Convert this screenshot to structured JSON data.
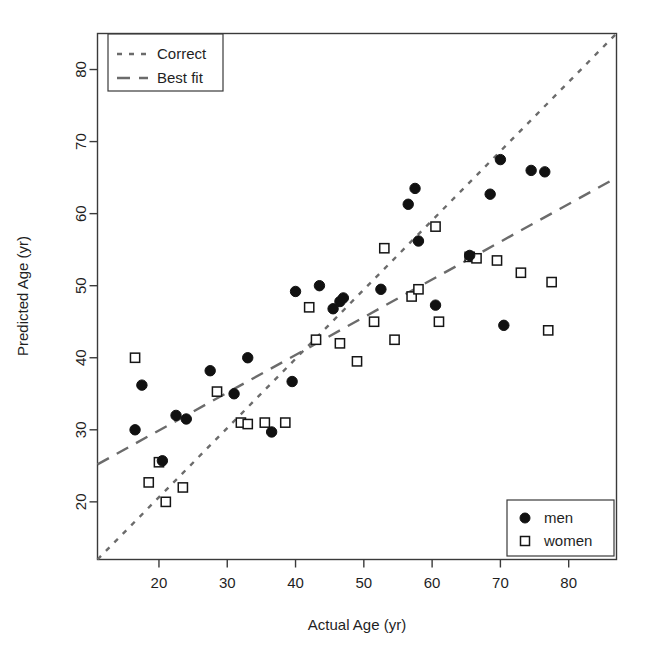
{
  "chart_data": {
    "type": "scatter",
    "title": "",
    "xlabel": "Actual Age (yr)",
    "ylabel": "Predicted Age (yr)",
    "xlim": [
      11,
      87
    ],
    "ylim": [
      12,
      85
    ],
    "xticks": [
      20,
      30,
      40,
      50,
      60,
      70,
      80
    ],
    "yticks": [
      20,
      30,
      40,
      50,
      60,
      70,
      80
    ],
    "grid": false,
    "legend_position": [
      "top-left",
      "bottom-right"
    ],
    "series": [
      {
        "name": "men",
        "marker": "filled-circle",
        "points": [
          [
            16.5,
            30.0
          ],
          [
            17.5,
            36.2
          ],
          [
            20.5,
            25.7
          ],
          [
            22.5,
            32.0
          ],
          [
            24.0,
            31.5
          ],
          [
            27.5,
            38.2
          ],
          [
            31.0,
            35.0
          ],
          [
            33.0,
            40.0
          ],
          [
            36.5,
            29.7
          ],
          [
            39.5,
            36.7
          ],
          [
            40.0,
            49.2
          ],
          [
            43.5,
            50.0
          ],
          [
            45.5,
            46.8
          ],
          [
            46.5,
            47.8
          ],
          [
            47.0,
            48.3
          ],
          [
            52.5,
            49.5
          ],
          [
            56.5,
            61.3
          ],
          [
            57.5,
            63.5
          ],
          [
            58.0,
            56.2
          ],
          [
            60.5,
            47.3
          ],
          [
            65.5,
            54.2
          ],
          [
            68.5,
            62.7
          ],
          [
            70.0,
            67.5
          ],
          [
            70.5,
            44.5
          ],
          [
            74.5,
            66.0
          ],
          [
            76.5,
            65.8
          ]
        ]
      },
      {
        "name": "women",
        "marker": "open-square",
        "points": [
          [
            16.5,
            40.0
          ],
          [
            18.5,
            22.7
          ],
          [
            20.0,
            25.5
          ],
          [
            21.0,
            20.0
          ],
          [
            23.5,
            22.0
          ],
          [
            28.5,
            35.3
          ],
          [
            32.0,
            31.0
          ],
          [
            33.0,
            30.8
          ],
          [
            35.5,
            31.0
          ],
          [
            38.5,
            31.0
          ],
          [
            42.0,
            47.0
          ],
          [
            43.0,
            42.5
          ],
          [
            46.5,
            42.0
          ],
          [
            49.0,
            39.5
          ],
          [
            51.5,
            45.0
          ],
          [
            53.0,
            55.2
          ],
          [
            54.5,
            42.5
          ],
          [
            57.0,
            48.5
          ],
          [
            58.0,
            49.5
          ],
          [
            60.5,
            58.2
          ],
          [
            61.0,
            45.0
          ],
          [
            65.5,
            54.0
          ],
          [
            66.5,
            53.8
          ],
          [
            69.5,
            53.5
          ],
          [
            73.0,
            51.8
          ],
          [
            77.5,
            50.5
          ],
          [
            77.0,
            43.8
          ]
        ]
      }
    ],
    "reference_lines": [
      {
        "name": "Correct",
        "style": "dotted",
        "from": [
          11,
          12
        ],
        "to": [
          87,
          85
        ],
        "description": "identity line y = x"
      },
      {
        "name": "Best fit",
        "style": "dashed",
        "from": [
          11,
          25.2
        ],
        "to": [
          87,
          65.0
        ],
        "description": "regression line"
      }
    ]
  },
  "legend_lines": {
    "title": "",
    "items": [
      {
        "label": "Correct",
        "style": "dotted"
      },
      {
        "label": "Best fit",
        "style": "dashed"
      }
    ]
  },
  "legend_points": {
    "title": "",
    "items": [
      {
        "label": "men",
        "marker": "filled-circle"
      },
      {
        "label": "women",
        "marker": "open-square"
      }
    ]
  },
  "axes": {
    "x": {
      "title": "Actual Age (yr)",
      "ticks": [
        "20",
        "30",
        "40",
        "50",
        "60",
        "70",
        "80"
      ]
    },
    "y": {
      "title": "Predicted Age (yr)",
      "ticks": [
        "20",
        "30",
        "40",
        "50",
        "60",
        "70",
        "80"
      ]
    }
  },
  "colors": {
    "background": "#ffffff",
    "axis": "#3a3a3a",
    "line": "#6b6b6b",
    "men_marker": "#111111",
    "women_marker": "#151515",
    "text": "#1f1f1f"
  }
}
